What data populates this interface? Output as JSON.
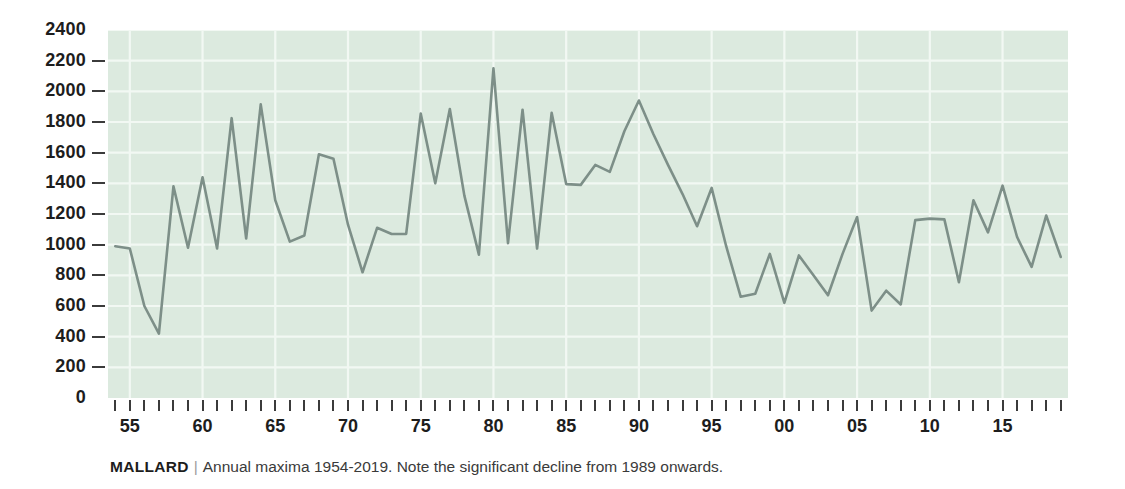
{
  "caption": {
    "title": "MALLARD",
    "separator": "|",
    "text": "Annual maxima 1954-2019. Note the significant decline from 1989 onwards."
  },
  "colors": {
    "plot_background": "#dceadf",
    "gridline": "#f2f8f3",
    "series_line": "#7d8f88",
    "axis_text": "#1d1d1d",
    "tick_mark": "#3b3b3b",
    "page_background": "#ffffff"
  },
  "chart_data": {
    "type": "line",
    "title": "MALLARD",
    "subtitle": "Annual maxima 1954-2019. Note the significant decline from 1989 onwards.",
    "xlabel": "",
    "ylabel": "",
    "xlim": [
      1953.5,
      2019.5
    ],
    "ylim": [
      0,
      2400
    ],
    "grid": true,
    "legend": false,
    "y_ticks": [
      0,
      200,
      400,
      600,
      800,
      1000,
      1200,
      1400,
      1600,
      1800,
      2000,
      2200,
      2400
    ],
    "x_tick_years": [
      1954,
      1955,
      1956,
      1957,
      1958,
      1959,
      1960,
      1961,
      1962,
      1963,
      1964,
      1965,
      1966,
      1967,
      1968,
      1969,
      1970,
      1971,
      1972,
      1973,
      1974,
      1975,
      1976,
      1977,
      1978,
      1979,
      1980,
      1981,
      1982,
      1983,
      1984,
      1985,
      1986,
      1987,
      1988,
      1989,
      1990,
      1991,
      1992,
      1993,
      1994,
      1995,
      1996,
      1997,
      1998,
      1999,
      2000,
      2001,
      2002,
      2003,
      2004,
      2005,
      2006,
      2007,
      2008,
      2009,
      2010,
      2011,
      2012,
      2013,
      2014,
      2015,
      2016,
      2017,
      2018,
      2019
    ],
    "x_labeled_ticks": [
      {
        "year": 1955,
        "label": "55"
      },
      {
        "year": 1960,
        "label": "60"
      },
      {
        "year": 1965,
        "label": "65"
      },
      {
        "year": 1970,
        "label": "70"
      },
      {
        "year": 1975,
        "label": "75"
      },
      {
        "year": 1980,
        "label": "80"
      },
      {
        "year": 1985,
        "label": "85"
      },
      {
        "year": 1990,
        "label": "90"
      },
      {
        "year": 1995,
        "label": "95"
      },
      {
        "year": 2000,
        "label": "00"
      },
      {
        "year": 2005,
        "label": "05"
      },
      {
        "year": 2010,
        "label": "10"
      },
      {
        "year": 2015,
        "label": "15"
      }
    ],
    "x": [
      1954,
      1955,
      1956,
      1957,
      1958,
      1959,
      1960,
      1961,
      1962,
      1963,
      1964,
      1965,
      1966,
      1967,
      1968,
      1969,
      1970,
      1971,
      1972,
      1973,
      1974,
      1975,
      1976,
      1977,
      1978,
      1979,
      1980,
      1981,
      1982,
      1983,
      1984,
      1985,
      1986,
      1987,
      1988,
      1989,
      1990,
      1991,
      1992,
      1993,
      1994,
      1995,
      1996,
      1997,
      1998,
      1999,
      2000,
      2001,
      2002,
      2003,
      2004,
      2005,
      2006,
      2007,
      2008,
      2009,
      2010,
      2011,
      2012,
      2013,
      2014,
      2015,
      2016,
      2017,
      2018,
      2019
    ],
    "series": [
      {
        "name": "Mallard annual maximum",
        "values": [
          990,
          975,
          600,
          420,
          1380,
          980,
          1440,
          975,
          1825,
          1040,
          1915,
          1290,
          1020,
          1060,
          1590,
          1560,
          1130,
          820,
          1110,
          1070,
          1070,
          1855,
          1400,
          1885,
          1320,
          935,
          2150,
          1010,
          1880,
          975,
          1860,
          1395,
          1390,
          1520,
          1475,
          1740,
          1940,
          1720,
          1520,
          1330,
          1120,
          1370,
          990,
          660,
          680,
          940,
          620,
          930,
          800,
          670,
          940,
          1180,
          570,
          700,
          610,
          1160,
          1170,
          1165,
          755,
          1290,
          1080,
          1385,
          1050,
          855,
          1190,
          920
        ]
      }
    ]
  }
}
